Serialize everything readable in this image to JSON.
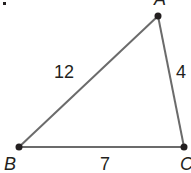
{
  "figure": {
    "problem_marker": ".",
    "vertices": [
      {
        "name": "A",
        "x": 158,
        "y": 16
      },
      {
        "name": "B",
        "x": 19,
        "y": 147
      },
      {
        "name": "C",
        "x": 184,
        "y": 147
      }
    ],
    "sides": [
      {
        "between": "AB",
        "length": "12"
      },
      {
        "between": "AC",
        "length": "4"
      },
      {
        "between": "BC",
        "length": "7"
      }
    ],
    "colors": {
      "line": "#6b6b6b",
      "point": "#231f20",
      "text": "#231f20"
    }
  }
}
